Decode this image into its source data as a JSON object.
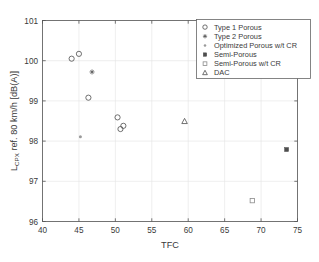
{
  "chart_data": {
    "type": "scatter",
    "title": "",
    "xlabel": "TFC",
    "ylabel": "L_CPX ref. 80 km/h [dB(A)]",
    "ylabel_parts": {
      "main_pre": "L",
      "sub": "CPX",
      "main_post": " ref. 80 km/h [dB(A)]"
    },
    "xlim": [
      40,
      75
    ],
    "ylim": [
      96,
      101
    ],
    "xticks": [
      40,
      45,
      50,
      55,
      60,
      65,
      70,
      75
    ],
    "yticks": [
      96,
      97,
      98,
      99,
      100,
      101
    ],
    "xtick_labels": [
      "40",
      "45",
      "50",
      "55",
      "60",
      "65",
      "70",
      "75"
    ],
    "ytick_labels": [
      "96",
      "97",
      "98",
      "99",
      "100",
      "101"
    ],
    "grid": true,
    "legend_position": "top-right",
    "series": [
      {
        "name": "Type 1 Porous",
        "marker": "circle-open",
        "color": "#4d4d4d",
        "points": [
          {
            "x": 44.0,
            "y": 100.05
          },
          {
            "x": 45.0,
            "y": 100.17
          },
          {
            "x": 46.3,
            "y": 99.08
          },
          {
            "x": 50.3,
            "y": 98.59
          },
          {
            "x": 50.7,
            "y": 98.3
          },
          {
            "x": 51.1,
            "y": 98.38
          }
        ]
      },
      {
        "name": "Type 2 Porous",
        "marker": "plus",
        "color": "#4d4d4d",
        "points": [
          {
            "x": 46.8,
            "y": 99.72
          }
        ]
      },
      {
        "name": "Optimized Porous w/t CR",
        "marker": "dot",
        "color": "#9a9a9a",
        "points": [
          {
            "x": 45.2,
            "y": 98.11
          }
        ]
      },
      {
        "name": "Semi-Porous",
        "marker": "square-filled",
        "color": "#4d4d4d",
        "points": [
          {
            "x": 73.5,
            "y": 97.79
          }
        ]
      },
      {
        "name": "Semi-Porous w/t CR",
        "marker": "square-open",
        "color": "#8a8a8a",
        "points": [
          {
            "x": 68.8,
            "y": 96.52
          }
        ]
      },
      {
        "name": "DAC",
        "marker": "triangle-open",
        "color": "#4d4d4d",
        "points": [
          {
            "x": 59.5,
            "y": 98.49
          }
        ]
      }
    ]
  },
  "legend": {
    "items": [
      {
        "label": "Type 1 Porous",
        "marker": "circle-open"
      },
      {
        "label": "Type 2 Porous",
        "marker": "plus"
      },
      {
        "label": "Optimized Porous w/t CR",
        "marker": "dot"
      },
      {
        "label": "Semi-Porous",
        "marker": "square-filled"
      },
      {
        "label": "Semi-Porous w/t CR",
        "marker": "square-open"
      },
      {
        "label": "DAC",
        "marker": "triangle-open"
      }
    ]
  },
  "colors": {
    "axis": "#555555",
    "grid": "#e3e3e3",
    "marker": "#4d4d4d",
    "background": "#ffffff",
    "legend_border": "#666666"
  }
}
